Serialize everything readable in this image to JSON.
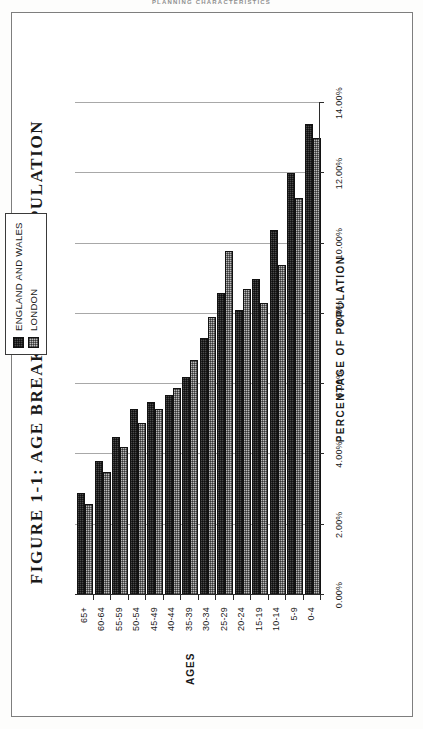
{
  "page_header": "PLANNING CHARACTERISTICS",
  "chart_data": {
    "type": "bar",
    "orientation": "horizontal",
    "title": "FIGURE 1-1: AGE BREAKDOWN OF POPULATION",
    "xlabel": "AGES",
    "ylabel": "PERCENTAGE OF POPULATION",
    "categories": [
      "0-4",
      "5-9",
      "10-14",
      "15-19",
      "20-24",
      "25-29",
      "30-34",
      "35-39",
      "40-44",
      "45-49",
      "50-54",
      "55-59",
      "60-64",
      "65+"
    ],
    "ylim": [
      0,
      14
    ],
    "ytick_labels": [
      "14.00%",
      "12.00%",
      "10.00%",
      "8.00%",
      "6.00%",
      "4.00%",
      "2.00%",
      "0.00%"
    ],
    "ytick_values": [
      14,
      12,
      10,
      8,
      6,
      4,
      2,
      0
    ],
    "grid": true,
    "legend_position": "top-right",
    "series": [
      {
        "name": "ENGLAND AND WALES",
        "key": "ew",
        "color": "#4a4a4a",
        "values": [
          13.4,
          12.0,
          10.4,
          9.0,
          8.1,
          8.6,
          7.3,
          6.2,
          5.7,
          5.5,
          5.3,
          4.5,
          3.8,
          2.9
        ]
      },
      {
        "name": "LONDON",
        "key": "ld",
        "color": "#b9b9b9",
        "values": [
          13.0,
          11.3,
          9.4,
          8.3,
          8.7,
          9.8,
          7.9,
          6.7,
          5.9,
          5.3,
          4.9,
          4.2,
          3.5,
          2.6
        ]
      }
    ]
  }
}
